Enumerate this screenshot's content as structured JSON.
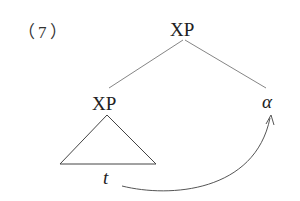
{
  "example_number": "（7）",
  "tree": {
    "root": {
      "label": "XP"
    },
    "left_child": {
      "label": "XP",
      "subtree": "triangle",
      "trace": "t"
    },
    "right_child": {
      "label": "α"
    }
  },
  "movement_arrow": {
    "from": "t",
    "to": "α"
  }
}
